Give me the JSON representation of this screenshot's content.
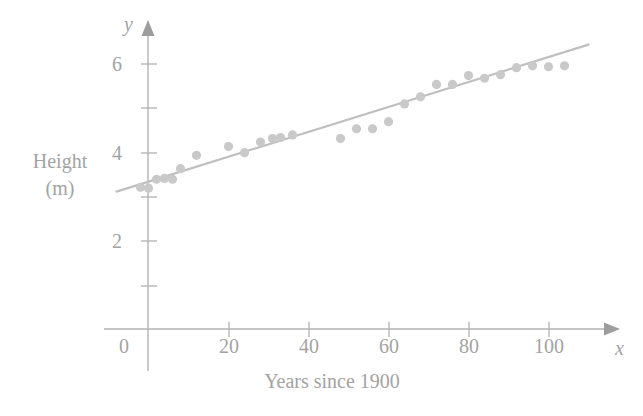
{
  "chart_data": {
    "type": "scatter",
    "title": "",
    "subtitle": "",
    "xlabel": "Years since 1900",
    "ylabel_lines": [
      "Height",
      "(m)"
    ],
    "x_axis_name": "x",
    "y_axis_name": "y",
    "xlim": [
      -12,
      115
    ],
    "ylim": [
      0,
      7.2
    ],
    "xticks": [
      0,
      20,
      40,
      60,
      80,
      100
    ],
    "xtick_labels": [
      "0",
      "20",
      "40",
      "60",
      "80",
      "100"
    ],
    "yticks": [
      1,
      2,
      3,
      4,
      5,
      6
    ],
    "ytick_labels": [
      "",
      "2",
      "",
      "4",
      "",
      "6"
    ],
    "grid": false,
    "legend": null,
    "series": [
      {
        "name": "Winning height",
        "marker": "circle",
        "color": "#c9c9c9",
        "points": [
          [
            -2.0,
            3.2
          ],
          [
            0.0,
            3.18
          ],
          [
            2.0,
            3.38
          ],
          [
            4.0,
            3.4
          ],
          [
            6.0,
            3.38
          ],
          [
            8.0,
            3.62
          ],
          [
            12.0,
            3.92
          ],
          [
            20.0,
            4.12
          ],
          [
            24.0,
            3.98
          ],
          [
            28.0,
            4.22
          ],
          [
            31.0,
            4.3
          ],
          [
            33.0,
            4.32
          ],
          [
            36.0,
            4.38
          ],
          [
            48.0,
            4.3
          ],
          [
            52.0,
            4.52
          ],
          [
            56.0,
            4.52
          ],
          [
            60.0,
            4.68
          ],
          [
            64.0,
            5.08
          ],
          [
            68.0,
            5.24
          ],
          [
            72.0,
            5.52
          ],
          [
            76.0,
            5.52
          ],
          [
            80.0,
            5.72
          ],
          [
            84.0,
            5.66
          ],
          [
            88.0,
            5.74
          ],
          [
            92.0,
            5.9
          ],
          [
            96.0,
            5.94
          ],
          [
            100.0,
            5.92
          ],
          [
            104.0,
            5.94
          ]
        ]
      }
    ],
    "fit_line": {
      "name": "Line of best fit",
      "color": "#bfbfbf",
      "x_start": -8.0,
      "y_start": 3.1,
      "x_end": 110.0,
      "y_end": 6.42
    }
  }
}
